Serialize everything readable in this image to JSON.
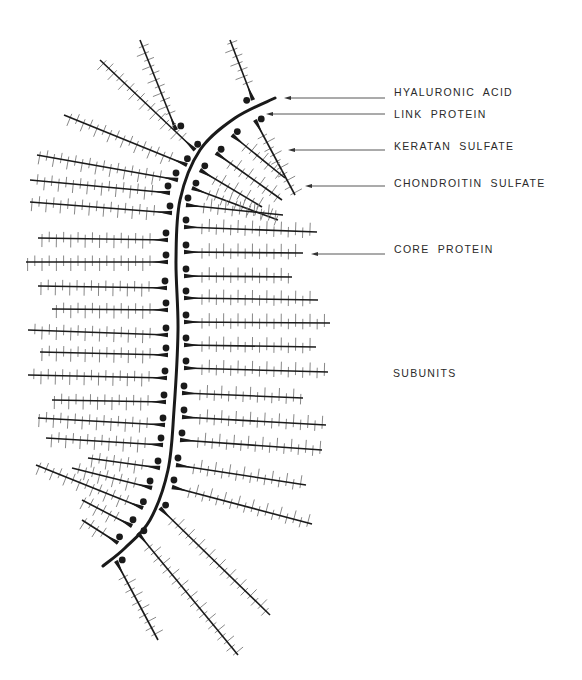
{
  "figure": {
    "colors": {
      "ink": "#1a1a1a",
      "ticks": "#7a7a7a",
      "background": "#ffffff"
    }
  },
  "labels": [
    {
      "id": "hyaluronic-acid",
      "text": "HYALURONIC ACID",
      "x": 394,
      "y": 92,
      "arrow": {
        "y": 98,
        "x1": 385,
        "x2": 284
      }
    },
    {
      "id": "link-protein",
      "text": "LINK PROTEIN",
      "x": 394,
      "y": 114,
      "arrow": {
        "y": 114,
        "x1": 385,
        "x2": 266
      }
    },
    {
      "id": "keratan-sulfate",
      "text": "KERATAN SULFATE",
      "x": 394,
      "y": 146,
      "arrow": {
        "y": 150,
        "x1": 385,
        "x2": 288
      }
    },
    {
      "id": "chondroitin-sulfate",
      "text": "CHONDROITIN SULFATE",
      "x": 394,
      "y": 183,
      "arrow": {
        "y": 186,
        "x1": 385,
        "x2": 305
      }
    },
    {
      "id": "core-protein",
      "text": "CORE PROTEIN",
      "x": 394,
      "y": 249,
      "arrow": {
        "y": 254,
        "x1": 385,
        "x2": 311
      }
    },
    {
      "id": "subunits",
      "text": "SUBUNITS",
      "x": 393,
      "y": 373,
      "arrow": null
    }
  ],
  "backbone": {
    "name": "hyaluronic acid chain",
    "points": [
      [
        275,
        98
      ],
      [
        235,
        118
      ],
      [
        200,
        150
      ],
      [
        180,
        200
      ],
      [
        176,
        260
      ],
      [
        178,
        330
      ],
      [
        174,
        410
      ],
      [
        168,
        470
      ],
      [
        150,
        520
      ],
      [
        125,
        548
      ],
      [
        103,
        566
      ]
    ]
  },
  "subunits": {
    "left": [
      {
        "y0": 130,
        "x0": 176,
        "x1": 140,
        "y1": 40
      },
      {
        "y0": 150,
        "x0": 195,
        "x1": 100,
        "y1": 60
      },
      {
        "y0": 165,
        "x0": 187,
        "x1": 64,
        "y1": 115
      },
      {
        "y0": 180,
        "x0": 178,
        "x1": 37,
        "y1": 155
      },
      {
        "y0": 193,
        "x0": 170,
        "x1": 30,
        "y1": 180
      },
      {
        "y0": 213,
        "x0": 172,
        "x1": 30,
        "y1": 202
      },
      {
        "y0": 240,
        "x0": 168,
        "x1": 38,
        "y1": 238
      },
      {
        "y0": 262,
        "x0": 168,
        "x1": 26,
        "y1": 262
      },
      {
        "y0": 288,
        "x0": 167,
        "x1": 38,
        "y1": 286
      },
      {
        "y0": 310,
        "x0": 168,
        "x1": 52,
        "y1": 309
      },
      {
        "y0": 335,
        "x0": 168,
        "x1": 28,
        "y1": 330
      },
      {
        "y0": 355,
        "x0": 168,
        "x1": 40,
        "y1": 352
      },
      {
        "y0": 378,
        "x0": 167,
        "x1": 28,
        "y1": 375
      },
      {
        "y0": 402,
        "x0": 166,
        "x1": 52,
        "y1": 400
      },
      {
        "y0": 425,
        "x0": 165,
        "x1": 38,
        "y1": 418
      },
      {
        "y0": 445,
        "x0": 163,
        "x1": 46,
        "y1": 438
      },
      {
        "y0": 468,
        "x0": 160,
        "x1": 88,
        "y1": 458
      },
      {
        "y0": 488,
        "x0": 152,
        "x1": 72,
        "y1": 468
      },
      {
        "y0": 508,
        "x0": 143,
        "x1": 36,
        "y1": 465
      },
      {
        "y0": 526,
        "x0": 132,
        "x1": 82,
        "y1": 500
      },
      {
        "y0": 543,
        "x0": 118,
        "x1": 82,
        "y1": 520
      }
    ],
    "right": [
      {
        "y0": 100,
        "x0": 253,
        "x1": 230,
        "y1": 40
      },
      {
        "y0": 120,
        "x0": 255,
        "x1": 295,
        "y1": 195
      },
      {
        "y0": 135,
        "x0": 232,
        "x1": 285,
        "y1": 178
      },
      {
        "y0": 153,
        "x0": 216,
        "x1": 282,
        "y1": 200
      },
      {
        "y0": 170,
        "x0": 200,
        "x1": 262,
        "y1": 207
      },
      {
        "y0": 188,
        "x0": 192,
        "x1": 278,
        "y1": 220
      },
      {
        "y0": 205,
        "x0": 186,
        "x1": 283,
        "y1": 215
      },
      {
        "y0": 227,
        "x0": 184,
        "x1": 317,
        "y1": 232
      },
      {
        "y0": 252,
        "x0": 184,
        "x1": 303,
        "y1": 253
      },
      {
        "y0": 276,
        "x0": 184,
        "x1": 292,
        "y1": 277
      },
      {
        "y0": 298,
        "x0": 184,
        "x1": 318,
        "y1": 300
      },
      {
        "y0": 322,
        "x0": 184,
        "x1": 330,
        "y1": 323
      },
      {
        "y0": 345,
        "x0": 184,
        "x1": 316,
        "y1": 347
      },
      {
        "y0": 368,
        "x0": 184,
        "x1": 328,
        "y1": 372
      },
      {
        "y0": 393,
        "x0": 182,
        "x1": 303,
        "y1": 398
      },
      {
        "y0": 417,
        "x0": 182,
        "x1": 326,
        "y1": 425
      },
      {
        "y0": 440,
        "x0": 180,
        "x1": 322,
        "y1": 450
      },
      {
        "y0": 465,
        "x0": 176,
        "x1": 306,
        "y1": 485
      },
      {
        "y0": 487,
        "x0": 172,
        "x1": 312,
        "y1": 524
      },
      {
        "y0": 508,
        "x0": 160,
        "x1": 270,
        "y1": 615
      },
      {
        "y0": 533,
        "x0": 138,
        "x1": 238,
        "y1": 655
      },
      {
        "y0": 561,
        "x0": 116,
        "x1": 158,
        "y1": 640
      }
    ]
  }
}
